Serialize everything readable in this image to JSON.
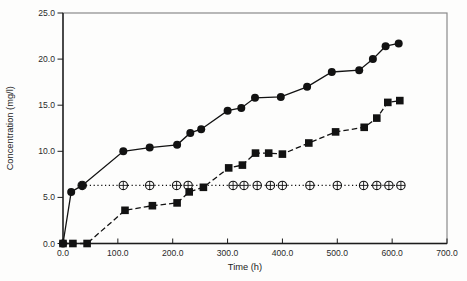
{
  "figure": {
    "background": "#fdfdfc",
    "frame_color": "#8a8a8a",
    "axis_color": "#1c1c1c",
    "series_color": "#121212",
    "marker_fill_open": "#fdfdfc"
  },
  "chart_data": {
    "type": "line",
    "title": "",
    "xlabel": "Time (h)",
    "ylabel": "Concentration (mg/l)",
    "xlim": [
      0,
      700
    ],
    "ylim": [
      0,
      25
    ],
    "grid": false,
    "legend": "none",
    "xticks": [
      {
        "v": 0,
        "label": "0.0"
      },
      {
        "v": 100,
        "label": "100.0"
      },
      {
        "v": 200,
        "label": "200.0"
      },
      {
        "v": 300,
        "label": "300.0"
      },
      {
        "v": 400,
        "label": "400.0"
      },
      {
        "v": 500,
        "label": "500.0"
      },
      {
        "v": 600,
        "label": "600.0"
      },
      {
        "v": 700,
        "label": "700.0"
      }
    ],
    "yticks": [
      {
        "v": 0,
        "label": "0.0"
      },
      {
        "v": 5,
        "label": "5.0"
      },
      {
        "v": 10,
        "label": "10.0"
      },
      {
        "v": 15,
        "label": "15.0"
      },
      {
        "v": 20,
        "label": "20.0"
      },
      {
        "v": 25,
        "label": "25.0"
      }
    ],
    "series": [
      {
        "name": "constant-circle-plus-series",
        "marker": "circle-plus",
        "line_style": "dotted",
        "points": [
          [
            35,
            6.3
          ],
          [
            110,
            6.3
          ],
          [
            158,
            6.3
          ],
          [
            207,
            6.3
          ],
          [
            228,
            6.3
          ],
          [
            310,
            6.3
          ],
          [
            330,
            6.3
          ],
          [
            354,
            6.3
          ],
          [
            378,
            6.3
          ],
          [
            400,
            6.3
          ],
          [
            450,
            6.3
          ],
          [
            500,
            6.3
          ],
          [
            548,
            6.3
          ],
          [
            572,
            6.3
          ],
          [
            594,
            6.3
          ],
          [
            616,
            6.3
          ]
        ]
      },
      {
        "name": "filled-square-dashed-series",
        "marker": "filled-square",
        "line_style": "dashed",
        "points": [
          [
            0,
            0
          ],
          [
            18,
            0
          ],
          [
            44,
            0
          ],
          [
            113,
            3.6
          ],
          [
            163,
            4.1
          ],
          [
            208,
            4.4
          ],
          [
            230,
            5.6
          ],
          [
            256,
            6.1
          ],
          [
            302,
            8.2
          ],
          [
            327,
            8.5
          ],
          [
            351,
            9.8
          ],
          [
            375,
            9.8
          ],
          [
            400,
            9.7
          ],
          [
            448,
            10.9
          ],
          [
            497,
            12.1
          ],
          [
            549,
            12.6
          ],
          [
            572,
            13.6
          ],
          [
            592,
            15.3
          ],
          [
            614,
            15.5
          ]
        ]
      },
      {
        "name": "filled-circle-solid-series",
        "marker": "filled-circle",
        "line_style": "solid",
        "points": [
          [
            0,
            0
          ],
          [
            15,
            5.6
          ],
          [
            35,
            6.3
          ],
          [
            110,
            10.0
          ],
          [
            158,
            10.4
          ],
          [
            208,
            10.7
          ],
          [
            232,
            12.0
          ],
          [
            252,
            12.4
          ],
          [
            300,
            14.4
          ],
          [
            325,
            14.7
          ],
          [
            350,
            15.8
          ],
          [
            397,
            15.9
          ],
          [
            445,
            17.0
          ],
          [
            490,
            18.6
          ],
          [
            540,
            18.8
          ],
          [
            565,
            20.0
          ],
          [
            588,
            21.4
          ],
          [
            612,
            21.7
          ]
        ]
      }
    ]
  }
}
